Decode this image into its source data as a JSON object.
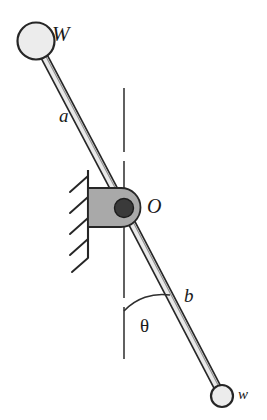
{
  "figure": {
    "type": "mechanical-diagram",
    "labels": {
      "top_weight": "W",
      "upper_arm": "a",
      "pivot": "O",
      "lower_arm": "b",
      "angle": "θ",
      "bottom_weight": "w"
    },
    "colors": {
      "stroke": "#262626",
      "rod_fill": "#e8e8e8",
      "circle_fill": "#ededed",
      "block_fill": "#a8a8a8",
      "pin_fill": "#3a3a3a",
      "background": "#ffffff"
    },
    "geometry": {
      "pivot_center": [
        124,
        208
      ],
      "upper_ball_center": [
        36,
        41
      ],
      "upper_ball_radius": 18,
      "lower_ball_center": [
        222,
        396
      ],
      "lower_ball_radius": 11,
      "rod_width": 7,
      "block_rect": [
        88,
        188,
        52,
        39
      ],
      "pin_radius": 9,
      "wall_x": 88,
      "wall_top": 170,
      "wall_bottom": 258,
      "hatch_count": 5,
      "dashed_line_x": 124,
      "dashed_line_top": 88,
      "dashed_line_bottom": 366,
      "angle_arc_radius": 52,
      "angle_degrees": 28
    }
  }
}
